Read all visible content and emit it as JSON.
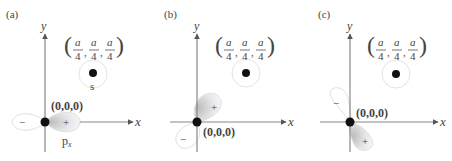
{
  "panels": [
    {
      "id": "a",
      "label": "(a)",
      "origin_label": "(0,0,0)",
      "s_site_label": "(a/4, a/4, a/4)",
      "s_label": "s",
      "orbital_label": "p",
      "orbital_subscript": "x",
      "plus_sign": "+",
      "minus_sign": "−",
      "x_axis": "x",
      "y_axis": "y"
    },
    {
      "id": "b",
      "label": "(b)",
      "origin_label": "(0,0,0)",
      "s_site_label": "(a/4, a/4, a/4)",
      "plus_sign": "+",
      "minus_sign": "−",
      "x_axis": "x",
      "y_axis": "y"
    },
    {
      "id": "c",
      "label": "(c)",
      "origin_label": "(0,0,0)",
      "s_site_label": "(a/4, a/4, a/4)",
      "plus_sign": "+",
      "minus_sign": "−",
      "x_axis": "x",
      "y_axis": "y"
    }
  ],
  "fraction": {
    "numerator": "a",
    "denominator": "4"
  },
  "colors": {
    "axis": "#888888",
    "dot": "#111111",
    "lobe_outline": "#dddddd",
    "lobe_fill_plus": "#d4d4d4",
    "circle": "#e4e4e4"
  }
}
